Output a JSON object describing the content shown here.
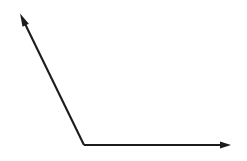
{
  "document": {
    "title": "Angle Diagram",
    "background_color": "#ffffff",
    "width": 247,
    "height": 161
  },
  "diagram": {
    "type": "line-diagram",
    "stroke_color": "#1c1c1c",
    "stroke_width": 2.1,
    "vertex_label": "",
    "shapes": [
      {
        "name": "diagonal-ray",
        "kind": "ray",
        "from": {
          "x": 84.0,
          "y": 145.0
        },
        "to": {
          "x": 21.5,
          "y": 16.0
        },
        "arrow_at": "to",
        "direction": "up-left"
      },
      {
        "name": "horizontal-ray",
        "kind": "ray",
        "from": {
          "x": 84.0,
          "y": 145.0
        },
        "to": {
          "x": 229.0,
          "y": 145.0
        },
        "arrow_at": "to",
        "direction": "right"
      }
    ],
    "vertex": {
      "x": 84.0,
      "y": 145.0
    },
    "arrowheads": [
      {
        "name": "upper-left-arrowhead",
        "tip": {
          "x": 20.0,
          "y": 13.5
        },
        "length": 13,
        "width": 7,
        "angle_deg": 244.2
      },
      {
        "name": "right-arrowhead",
        "tip": {
          "x": 231.0,
          "y": 145.0
        },
        "length": 11,
        "width": 7,
        "angle_deg": 0
      }
    ]
  }
}
